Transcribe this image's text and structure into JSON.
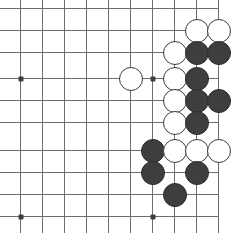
{
  "diagram": {
    "kind": "go-board-diagram",
    "board": {
      "columns": 10,
      "rows": 10,
      "cell_size": 22,
      "origin_x": 20,
      "origin_y": 8,
      "line_color": "#6b6b6b",
      "background_color": "#ffffff",
      "stone_radius": 12,
      "cropped_edges": [
        "top",
        "left"
      ]
    },
    "star_points": [
      {
        "x": 20,
        "y": 78
      },
      {
        "x": 152,
        "y": 78
      },
      {
        "x": 20,
        "y": 216
      },
      {
        "x": 152,
        "y": 216
      }
    ],
    "colors": {
      "black_stone": "#3b3b3b",
      "black_stone_edge": "#2a2a2a",
      "white_stone": "#ffffff",
      "white_stone_edge": "#3b3b3b",
      "grid": "#6b6b6b",
      "star": "#3a3a3a"
    },
    "grid_x": [
      20,
      42,
      64,
      86,
      108,
      130,
      152,
      174,
      196,
      218
    ],
    "grid_y": [
      8,
      30,
      52,
      78,
      100,
      122,
      150,
      172,
      194,
      216
    ],
    "stones": [
      {
        "color": "white",
        "x": 196,
        "y": 30
      },
      {
        "color": "white",
        "x": 218,
        "y": 30
      },
      {
        "color": "white",
        "x": 174,
        "y": 52
      },
      {
        "color": "black",
        "x": 196,
        "y": 52
      },
      {
        "color": "black",
        "x": 218,
        "y": 52
      },
      {
        "color": "white",
        "x": 130,
        "y": 78
      },
      {
        "color": "white",
        "x": 174,
        "y": 78
      },
      {
        "color": "black",
        "x": 196,
        "y": 78
      },
      {
        "color": "white",
        "x": 174,
        "y": 100
      },
      {
        "color": "black",
        "x": 196,
        "y": 100
      },
      {
        "color": "black",
        "x": 218,
        "y": 100
      },
      {
        "color": "white",
        "x": 174,
        "y": 122
      },
      {
        "color": "black",
        "x": 196,
        "y": 122
      },
      {
        "color": "black",
        "x": 152,
        "y": 150
      },
      {
        "color": "white",
        "x": 174,
        "y": 150
      },
      {
        "color": "white",
        "x": 196,
        "y": 150
      },
      {
        "color": "white",
        "x": 218,
        "y": 150
      },
      {
        "color": "black",
        "x": 152,
        "y": 172
      },
      {
        "color": "black",
        "x": 196,
        "y": 172
      },
      {
        "color": "black",
        "x": 174,
        "y": 194
      }
    ]
  }
}
